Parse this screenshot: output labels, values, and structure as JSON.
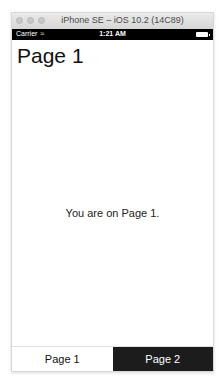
{
  "window": {
    "title": "iPhone SE – iOS 10.2 (14C89)"
  },
  "status_bar": {
    "carrier": "Carrier",
    "wifi_icon": "wifi-icon",
    "time": "1:21 AM",
    "battery_icon": "battery-icon"
  },
  "page": {
    "title": "Page 1",
    "message": "You are on Page 1."
  },
  "tabs": [
    {
      "label": "Page 1",
      "active": true,
      "background": "#ffffff"
    },
    {
      "label": "Page 2",
      "active": false,
      "background": "#1c1c1c"
    }
  ]
}
